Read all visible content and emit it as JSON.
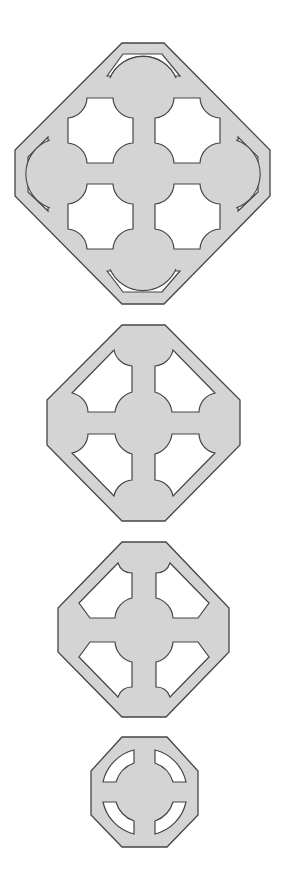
{
  "figure": {
    "colors": {
      "fill": "#d4d4d4",
      "stroke": "#454545",
      "background": "#ffffff",
      "hole": "#ffffff"
    },
    "shapes": [
      {
        "id": 1,
        "label": "large octagon with four square openings and four edge slots"
      },
      {
        "id": 2,
        "label": "octagon with four pentagonal openings around a central hub"
      },
      {
        "id": 3,
        "label": "octagon with four chamfered openings around a central hub"
      },
      {
        "id": 4,
        "label": "small octagon with four arc-shaped slots"
      }
    ]
  }
}
